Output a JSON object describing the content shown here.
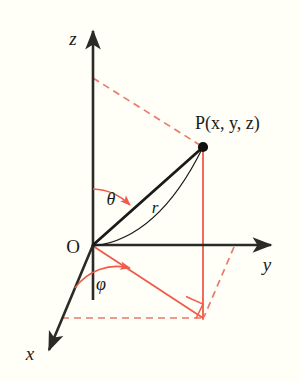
{
  "figure": {
    "name": "spherical-coordinate-system-diagram",
    "background_color": "#fffef7",
    "axis_color": "#2b2b26",
    "projection_color": "#ef5b4c",
    "dashed_color": "#e8796c",
    "radius_color": "#1a1a1a",
    "width": 301,
    "height": 382
  },
  "labels": {
    "z_axis": "z",
    "y_axis": "y",
    "x_axis": "x",
    "origin": "O",
    "point": "P(x, y, z)",
    "radius": "r",
    "polar_angle": "θ",
    "azimuth_angle": "φ"
  },
  "geometry": {
    "origin": {
      "x": 93,
      "y": 245
    },
    "point_p": {
      "x": 203,
      "y": 147
    },
    "z_axis_tip": {
      "x": 93,
      "y": 26
    },
    "y_axis_tip": {
      "x": 277,
      "y": 245
    },
    "x_axis_tip": {
      "x": 45,
      "y": 357
    },
    "projection_xy": {
      "x": 203,
      "y": 318
    },
    "z_dash_foot": {
      "x": 93,
      "y": 78
    },
    "x_dash_foot": {
      "x": 62,
      "y": 318
    },
    "y_dash_foot": {
      "x": 234,
      "y": 247
    }
  }
}
